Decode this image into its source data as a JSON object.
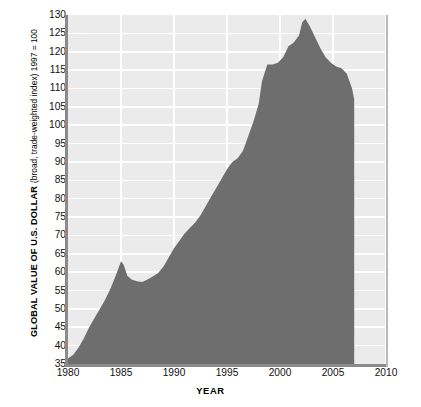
{
  "chart_data": {
    "type": "area",
    "title": "",
    "xlabel": "YEAR",
    "ylabel": "GLOBAL VALUE OF U.S. DOLLAR",
    "ylabel_sub": "(broad, trade-weighted index) 1997 = 100",
    "xlim": [
      1980,
      2010
    ],
    "ylim": [
      35,
      130
    ],
    "xticks": [
      1980,
      1985,
      1990,
      1995,
      2000,
      2005,
      2010
    ],
    "xtick_labels": [
      "1980",
      "1985",
      "1990",
      "1995",
      "2000",
      "2005",
      "2010"
    ],
    "yticks": [
      35,
      40,
      45,
      50,
      55,
      60,
      65,
      70,
      75,
      80,
      85,
      90,
      95,
      100,
      105,
      110,
      115,
      120,
      125,
      130
    ],
    "ytick_labels": [
      "35",
      "40",
      "45",
      "50",
      "55",
      "60",
      "65",
      "70",
      "75",
      "80",
      "85",
      "90",
      "95",
      "100",
      "105",
      "110",
      "115",
      "120",
      "125",
      "130"
    ],
    "grid": true,
    "legend": "none",
    "series": [
      {
        "name": "Global value of U.S. dollar (broad, trade-weighted index)",
        "fill_color": "#6e6e6e",
        "x": [
          1980.0,
          1980.5,
          1981.0,
          1981.5,
          1982.0,
          1982.5,
          1983.0,
          1983.5,
          1984.0,
          1984.5,
          1985.0,
          1985.25,
          1985.6,
          1986.0,
          1986.5,
          1987.0,
          1987.5,
          1988.0,
          1988.5,
          1989.0,
          1989.5,
          1990.0,
          1990.5,
          1991.0,
          1991.5,
          1992.0,
          1992.5,
          1993.0,
          1993.5,
          1994.0,
          1994.5,
          1995.0,
          1995.5,
          1996.0,
          1996.5,
          1997.0,
          1997.5,
          1998.0,
          1998.3,
          1998.8,
          1999.3,
          1999.8,
          2000.3,
          2000.8,
          2001.3,
          2001.8,
          2002.1,
          2002.4,
          2002.8,
          2003.3,
          2003.8,
          2004.3,
          2004.8,
          2005.3,
          2005.8,
          2006.3,
          2006.8,
          2007.0
        ],
        "y": [
          36.5,
          37.5,
          39.5,
          42.0,
          45.0,
          47.5,
          50.0,
          52.5,
          55.5,
          59.0,
          63.0,
          62.0,
          59.0,
          58.0,
          57.5,
          57.3,
          58.0,
          58.8,
          59.8,
          61.5,
          64.0,
          66.5,
          68.5,
          70.5,
          72.0,
          73.5,
          75.5,
          78.0,
          80.5,
          83.0,
          85.5,
          88.0,
          90.0,
          91.0,
          93.0,
          97.0,
          101.0,
          106.0,
          112.0,
          116.5,
          116.5,
          117.0,
          118.5,
          121.5,
          122.5,
          124.5,
          128.0,
          129.0,
          127.0,
          124.0,
          121.0,
          118.5,
          117.0,
          116.0,
          115.5,
          114.0,
          110.0,
          107.0
        ]
      }
    ]
  }
}
